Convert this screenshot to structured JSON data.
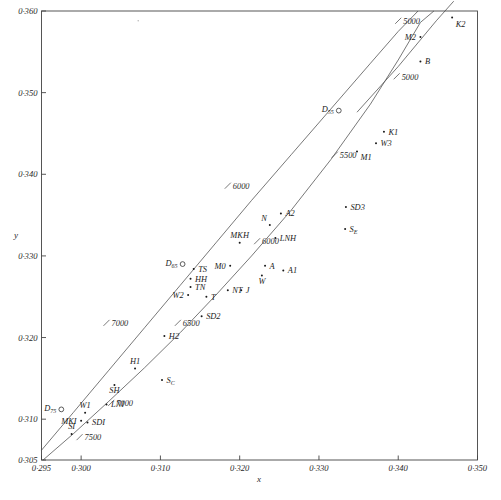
{
  "chart_data": {
    "type": "scatter",
    "title": "",
    "xlabel": "x",
    "ylabel": "y",
    "xlim": [
      0.295,
      0.35
    ],
    "ylim": [
      0.305,
      0.36
    ],
    "grid": false,
    "legend": "none",
    "x_ticks": [
      {
        "value": 0.295,
        "label": "0·295"
      },
      {
        "value": 0.3,
        "label": "0·300"
      },
      {
        "value": 0.31,
        "label": "0·310"
      },
      {
        "value": 0.32,
        "label": "0·320"
      },
      {
        "value": 0.33,
        "label": "0·330"
      },
      {
        "value": 0.34,
        "label": "0·340"
      },
      {
        "value": 0.35,
        "label": "0·350"
      }
    ],
    "y_ticks": [
      {
        "value": 0.305,
        "label": "0·305"
      },
      {
        "value": 0.31,
        "label": "0·310"
      },
      {
        "value": 0.32,
        "label": "0·320"
      },
      {
        "value": 0.33,
        "label": "0·330"
      },
      {
        "value": 0.34,
        "label": "0·340"
      },
      {
        "value": 0.35,
        "label": "0·350"
      },
      {
        "value": 0.36,
        "label": "0·360"
      }
    ],
    "series": [
      {
        "name": "daylight-locus",
        "type": "line",
        "points": [
          [
            0.295,
            0.3062
          ],
          [
            0.299,
            0.3108
          ],
          [
            0.3035,
            0.316
          ],
          [
            0.308,
            0.3212
          ],
          [
            0.3125,
            0.3264
          ],
          [
            0.317,
            0.3316
          ],
          [
            0.3215,
            0.3368
          ],
          [
            0.3265,
            0.3424
          ],
          [
            0.3315,
            0.348
          ],
          [
            0.3365,
            0.3536
          ],
          [
            0.34,
            0.3575
          ],
          [
            0.3425,
            0.36
          ]
        ],
        "temperature_labels": [
          {
            "text": "7000",
            "x": 0.3032,
            "y": 0.3218
          },
          {
            "text": "6000",
            "x": 0.3185,
            "y": 0.3386
          },
          {
            "text": "5000",
            "x": 0.34,
            "y": 0.3588
          }
        ]
      },
      {
        "name": "planckian-locus",
        "type": "line",
        "points": [
          [
            0.2952,
            0.305
          ],
          [
            0.299,
            0.3082
          ],
          [
            0.3035,
            0.3122
          ],
          [
            0.308,
            0.3163
          ],
          [
            0.3125,
            0.3206
          ],
          [
            0.317,
            0.3252
          ],
          [
            0.3215,
            0.33
          ],
          [
            0.3265,
            0.3356
          ],
          [
            0.3315,
            0.3418
          ],
          [
            0.3365,
            0.3486
          ],
          [
            0.34,
            0.354
          ],
          [
            0.3428,
            0.3586
          ],
          [
            0.3445,
            0.36
          ]
        ],
        "temperature_labels": [
          {
            "text": "7500",
            "x": 0.2998,
            "y": 0.3078
          },
          {
            "text": "7000",
            "x": 0.3038,
            "y": 0.312
          },
          {
            "text": "6500",
            "x": 0.3122,
            "y": 0.3218
          },
          {
            "text": "6000",
            "x": 0.3222,
            "y": 0.3318
          },
          {
            "text": "5500",
            "x": 0.332,
            "y": 0.3424
          },
          {
            "text": "5000",
            "x": 0.3398,
            "y": 0.352
          }
        ]
      },
      {
        "name": "lower-locus",
        "type": "line",
        "points": [
          [
            0.3348,
            0.3476
          ],
          [
            0.34,
            0.3532
          ],
          [
            0.3448,
            0.3588
          ],
          [
            0.347,
            0.3612
          ]
        ],
        "temperature_labels": []
      }
    ],
    "reference_points": [
      {
        "label": "D",
        "subscript": "75",
        "x": 0.2975,
        "y": 0.3112,
        "marker": "ring",
        "label_pos": "left"
      },
      {
        "label": "D",
        "subscript": "65",
        "x": 0.3128,
        "y": 0.329,
        "marker": "ring",
        "label_pos": "left"
      },
      {
        "label": "D",
        "subscript": "55",
        "x": 0.3325,
        "y": 0.3478,
        "marker": "ring",
        "label_pos": "left"
      }
    ],
    "data_points": [
      {
        "label": "K2",
        "x": 0.3468,
        "y": 0.3592,
        "label_pos": "below-right"
      },
      {
        "label": "M2",
        "x": 0.3428,
        "y": 0.3568,
        "label_pos": "left"
      },
      {
        "label": "B",
        "x": 0.3428,
        "y": 0.3538,
        "label_pos": "right"
      },
      {
        "label": "K1",
        "x": 0.3382,
        "y": 0.3452,
        "label_pos": "right"
      },
      {
        "label": "W3",
        "x": 0.3372,
        "y": 0.3438,
        "label_pos": "right"
      },
      {
        "label": "M1",
        "x": 0.3348,
        "y": 0.3428,
        "label_pos": "below-right"
      },
      {
        "label": "SD3",
        "x": 0.3334,
        "y": 0.336,
        "label_pos": "right"
      },
      {
        "label": "S",
        "subscript": "E",
        "x": 0.3333,
        "y": 0.3333,
        "label_pos": "right"
      },
      {
        "label": "A2",
        "x": 0.3252,
        "y": 0.3352,
        "label_pos": "right"
      },
      {
        "label": "N",
        "x": 0.3238,
        "y": 0.3338,
        "label_pos": "above-left"
      },
      {
        "label": "LNH",
        "x": 0.3245,
        "y": 0.3322,
        "label_pos": "right"
      },
      {
        "label": "MKH",
        "x": 0.32,
        "y": 0.3316,
        "label_pos": "above"
      },
      {
        "label": "M0",
        "x": 0.3188,
        "y": 0.3288,
        "label_pos": "left"
      },
      {
        "label": "A",
        "x": 0.3232,
        "y": 0.3288,
        "label_pos": "right"
      },
      {
        "label": "A1",
        "x": 0.3255,
        "y": 0.3282,
        "label_pos": "right"
      },
      {
        "label": "W",
        "x": 0.3228,
        "y": 0.3276,
        "label_pos": "below"
      },
      {
        "label": "TS",
        "x": 0.3142,
        "y": 0.3284,
        "label_pos": "right"
      },
      {
        "label": "HH",
        "x": 0.3138,
        "y": 0.3272,
        "label_pos": "right"
      },
      {
        "label": "TN",
        "x": 0.3138,
        "y": 0.3262,
        "label_pos": "right"
      },
      {
        "label": "W2",
        "x": 0.3135,
        "y": 0.3252,
        "label_pos": "left"
      },
      {
        "label": "T",
        "x": 0.3158,
        "y": 0.325,
        "label_pos": "right"
      },
      {
        "label": "NT",
        "x": 0.3185,
        "y": 0.3258,
        "label_pos": "right"
      },
      {
        "label": "J",
        "x": 0.3202,
        "y": 0.3258,
        "label_pos": "right"
      },
      {
        "label": "SD2",
        "x": 0.3152,
        "y": 0.3226,
        "label_pos": "right"
      },
      {
        "label": "H2",
        "x": 0.3105,
        "y": 0.3202,
        "label_pos": "right"
      },
      {
        "label": "H1",
        "x": 0.3068,
        "y": 0.3162,
        "label_pos": "above"
      },
      {
        "label": "SH",
        "x": 0.3042,
        "y": 0.3142,
        "label_pos": "below"
      },
      {
        "label": "S",
        "subscript": "C",
        "x": 0.3102,
        "y": 0.3148,
        "label_pos": "right"
      },
      {
        "label": "LNI",
        "x": 0.3032,
        "y": 0.3118,
        "label_pos": "right"
      },
      {
        "label": "W1",
        "x": 0.3005,
        "y": 0.3108,
        "label_pos": "above"
      },
      {
        "label": "MKI",
        "x": 0.3,
        "y": 0.3098,
        "label_pos": "left"
      },
      {
        "label": "SDI",
        "x": 0.3008,
        "y": 0.3096,
        "label_pos": "right"
      },
      {
        "label": "SI",
        "x": 0.2988,
        "y": 0.3082,
        "label_pos": "above"
      }
    ],
    "stray_marks": [
      {
        "x": 0.3072,
        "y": 0.3588
      }
    ]
  },
  "axes": {
    "x_axis_title": "x",
    "y_axis_title": "y"
  }
}
